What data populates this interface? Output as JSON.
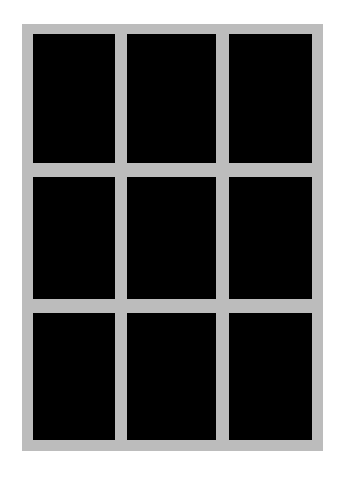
{
  "image": {
    "description": "3x3 grid of black rectangular panes within a light gray frame",
    "frame_color": "#bcbcbc",
    "pane_color": "#000000",
    "background_color": "#ffffff",
    "rows": 3,
    "columns": 3
  }
}
